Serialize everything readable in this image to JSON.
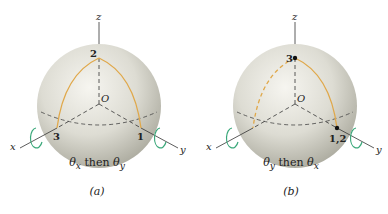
{
  "colors": {
    "sphere_light": "#f4f3ee",
    "sphere_dark": "#b9b8ad",
    "path": "#e0a84a",
    "arrow": "#3aa87a",
    "axis": "#333333"
  },
  "panels": [
    {
      "id": "a",
      "axis_labels": {
        "z": "z",
        "x": "x",
        "y": "y",
        "origin": "O"
      },
      "points": [
        {
          "label": "2",
          "pos": "top"
        },
        {
          "label": "3",
          "pos": "x-equator"
        },
        {
          "label": "1",
          "pos": "y-equator"
        }
      ],
      "caption": "θx then θy",
      "caption_main_1": "θ",
      "caption_sub_1": "x",
      "caption_mid": " then ",
      "caption_main_2": "θ",
      "caption_sub_2": "y",
      "sublabel": "(a)"
    },
    {
      "id": "b",
      "axis_labels": {
        "z": "z",
        "x": "x",
        "y": "y",
        "origin": "O"
      },
      "points": [
        {
          "label": "3",
          "pos": "top"
        },
        {
          "label": "1,2",
          "pos": "y-equator"
        }
      ],
      "caption": "θy then θx",
      "caption_main_1": "θ",
      "caption_sub_1": "y",
      "caption_mid": " then ",
      "caption_main_2": "θ",
      "caption_sub_2": "x",
      "sublabel": "(b)"
    }
  ]
}
